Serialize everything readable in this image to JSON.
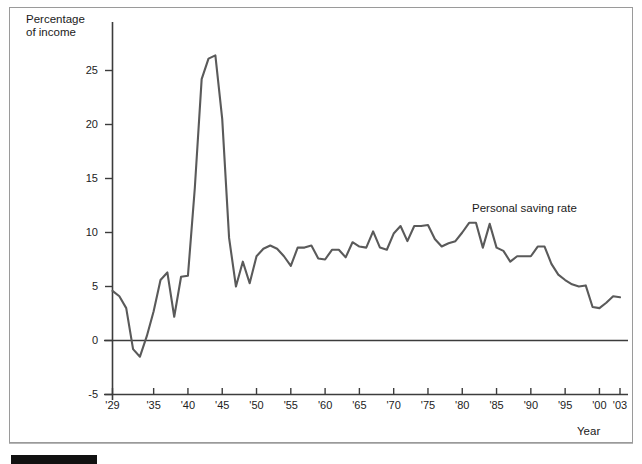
{
  "chart_data": {
    "type": "line",
    "title": "",
    "xlabel": "Year",
    "ylabel": "Percentage\nof income",
    "series_label": "Personal saving rate",
    "xlim": [
      1929,
      2003
    ],
    "ylim": [
      -5,
      27
    ],
    "ytick_values": [
      25,
      20,
      15,
      10,
      5,
      0,
      -5
    ],
    "ytick_labels": [
      "25",
      "20",
      "15",
      "10",
      "5",
      "0",
      "-5"
    ],
    "xtick_values": [
      1929,
      1935,
      1940,
      1945,
      1950,
      1955,
      1960,
      1965,
      1970,
      1975,
      1980,
      1985,
      1990,
      1995,
      2000,
      2003
    ],
    "xtick_labels": [
      "'29",
      "'35",
      "'40",
      "'45",
      "'50",
      "'55",
      "'60",
      "'65",
      "'70",
      "'75",
      "'80",
      "'85",
      "'90",
      "'95",
      "'00",
      "'03"
    ],
    "grid": false,
    "legend_position": "inline-annotation",
    "line_color": "#5a5a5a",
    "axis_color": "#3c3c3c",
    "x": [
      1929,
      1930,
      1931,
      1932,
      1933,
      1934,
      1935,
      1936,
      1937,
      1938,
      1939,
      1940,
      1941,
      1942,
      1943,
      1944,
      1945,
      1946,
      1947,
      1948,
      1949,
      1950,
      1951,
      1952,
      1953,
      1954,
      1955,
      1956,
      1957,
      1958,
      1959,
      1960,
      1961,
      1962,
      1963,
      1964,
      1965,
      1966,
      1967,
      1968,
      1969,
      1970,
      1971,
      1972,
      1973,
      1974,
      1975,
      1976,
      1977,
      1978,
      1979,
      1980,
      1981,
      1982,
      1983,
      1984,
      1985,
      1986,
      1987,
      1988,
      1989,
      1990,
      1991,
      1992,
      1993,
      1994,
      1995,
      1996,
      1997,
      1998,
      1999,
      2000,
      2001,
      2002,
      2003
    ],
    "y": [
      4.6,
      4.1,
      3.0,
      -0.8,
      -1.5,
      0.4,
      2.7,
      5.6,
      6.3,
      2.2,
      5.9,
      6.0,
      14.1,
      24.2,
      26.1,
      26.4,
      20.5,
      9.5,
      5.0,
      7.3,
      5.3,
      7.8,
      8.5,
      8.8,
      8.5,
      7.8,
      6.9,
      8.6,
      8.6,
      8.8,
      7.6,
      7.5,
      8.4,
      8.4,
      7.7,
      9.1,
      8.7,
      8.6,
      10.1,
      8.6,
      8.4,
      9.9,
      10.6,
      9.2,
      10.6,
      10.6,
      10.7,
      9.4,
      8.7,
      9.0,
      9.2,
      10.0,
      10.9,
      10.9,
      8.6,
      10.8,
      8.6,
      8.3,
      7.3,
      7.8,
      7.8,
      7.8,
      8.7,
      8.7,
      7.1,
      6.1,
      5.6,
      5.2,
      5.0,
      5.1,
      3.1,
      3.0,
      3.5,
      4.1,
      4.0
    ]
  },
  "annotations": {
    "series_label": "Personal saving rate"
  }
}
